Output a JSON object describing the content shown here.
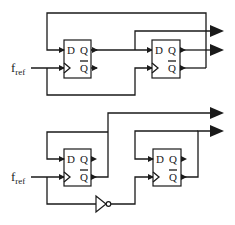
{
  "diagram": {
    "type": "circuit-schematic",
    "color": "#1a1a1a",
    "circuits": [
      {
        "name": "top-divider",
        "input_label": {
          "main": "f",
          "sub": "ref"
        },
        "flip_flops": [
          {
            "name": "ff1",
            "pins": {
              "d": "D",
              "q": "Q",
              "qbar": "Q"
            }
          },
          {
            "name": "ff2",
            "pins": {
              "d": "D",
              "q": "Q",
              "qbar": "Q"
            }
          }
        ],
        "outputs": 2
      },
      {
        "name": "bottom-divider",
        "input_label": {
          "main": "f",
          "sub": "ref"
        },
        "flip_flops": [
          {
            "name": "ff1",
            "pins": {
              "d": "D",
              "q": "Q",
              "qbar": "Q"
            }
          },
          {
            "name": "ff2",
            "pins": {
              "d": "D",
              "q": "Q",
              "qbar": "Q"
            }
          }
        ],
        "inverter": true,
        "outputs": 2
      }
    ]
  }
}
